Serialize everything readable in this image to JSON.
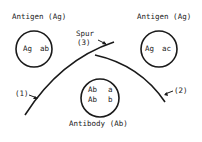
{
  "diagram": {
    "antigen_left": {
      "title": "Antigen (Ag)",
      "content_left": "Ag",
      "content_right": "ab"
    },
    "antigen_right": {
      "title": "Antigen (Ag)",
      "content_left": "Ag",
      "content_right": "ac"
    },
    "antibody": {
      "title": "Antibody (Ab)",
      "row1_left": "Ab",
      "row1_right": "a",
      "row2_left": "Ab",
      "row2_right": "b"
    },
    "spur": {
      "label": "Spur",
      "number": "(3)"
    },
    "line_left_label": "(1)",
    "line_right_label": "(2)",
    "stroke_color": "#1a1a1a"
  }
}
